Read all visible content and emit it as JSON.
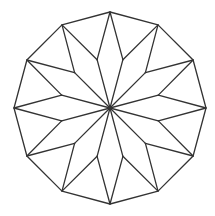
{
  "diagram": {
    "type": "geometric-star",
    "stroke_color": "#333333",
    "background": "#ffffff",
    "center": [
      110,
      108
    ],
    "outer_polygon": {
      "sides": 12,
      "radius": 96,
      "vertices": [
        [
          110,
          12
        ],
        [
          158,
          24.9
        ],
        [
          193.1,
          60
        ],
        [
          206,
          108
        ],
        [
          193.1,
          156
        ],
        [
          158,
          191.1
        ],
        [
          110,
          204
        ],
        [
          62,
          191.1
        ],
        [
          26.9,
          156
        ],
        [
          14,
          108
        ],
        [
          26.9,
          60
        ],
        [
          62,
          24.9
        ]
      ]
    },
    "inner_points": {
      "count": 12,
      "radius": 50,
      "vertices": [
        [
          122.9,
          59.7
        ],
        [
          145.4,
          72.6
        ],
        [
          158.3,
          95.1
        ],
        [
          158.3,
          120.9
        ],
        [
          145.4,
          143.4
        ],
        [
          122.9,
          156.3
        ],
        [
          97.1,
          156.3
        ],
        [
          74.6,
          143.4
        ],
        [
          61.7,
          120.9
        ],
        [
          61.7,
          95.1
        ],
        [
          74.6,
          72.6
        ],
        [
          97.1,
          59.7
        ]
      ]
    },
    "kite_count": 12
  }
}
